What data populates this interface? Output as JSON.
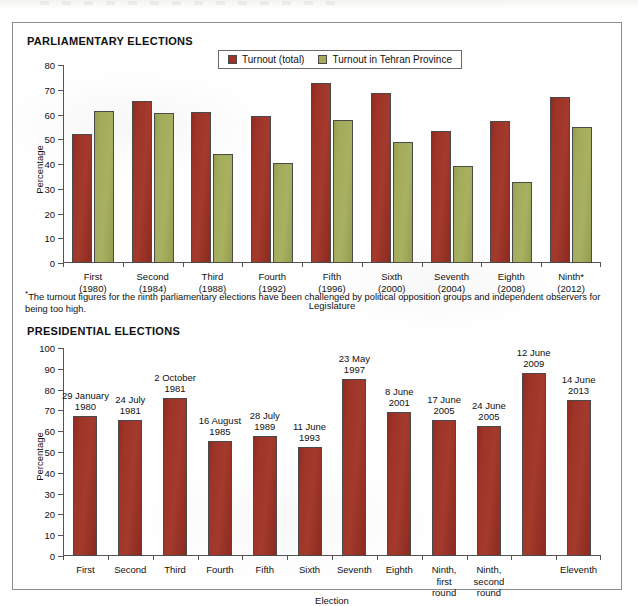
{
  "figure": {
    "parliamentary_title": "PARLIAMENTARY ELECTIONS",
    "presidential_title": "PRESIDENTIAL ELECTIONS",
    "footnote_marker": "*",
    "footnote": "The turnout figures for the ninth parliamentary elections have been challenged by political opposition groups and independent observers for being too high."
  },
  "colors": {
    "turnout_total": "#9e3328",
    "turnout_tehran": "#a3ab5b",
    "axis": "#555555",
    "text": "#111111",
    "frame": "#8c8c8c"
  },
  "chart_data": [
    {
      "id": "parliamentary",
      "type": "bar",
      "title": "PARLIAMENTARY ELECTIONS",
      "xlabel": "Legislature",
      "ylabel": "Percentage",
      "ylim": [
        0,
        80
      ],
      "yticks": [
        0,
        10,
        20,
        30,
        40,
        50,
        60,
        70,
        80
      ],
      "grid": false,
      "legend_position": "top-center",
      "categories": [
        "First\n(1980)",
        "Second\n(1984)",
        "Third\n(1988)",
        "Fourth\n(1992)",
        "Fifth\n(1996)",
        "Sixth\n(2000)",
        "Seventh\n(2004)",
        "Eighth\n(2008)",
        "Ninth*\n(2012)"
      ],
      "series": [
        {
          "name": "Turnout (total)",
          "color": "#9e3328",
          "values": [
            52.1,
            65.6,
            60.9,
            59.3,
            72.6,
            68.8,
            53.2,
            57.4,
            66.9
          ]
        },
        {
          "name": "Turnout in Tehran Province",
          "color": "#a3ab5b",
          "values": [
            61.3,
            60.7,
            44.0,
            40.4,
            57.8,
            48.9,
            39.4,
            32.9,
            55.0
          ]
        }
      ]
    },
    {
      "id": "presidential",
      "type": "bar",
      "title": "PRESIDENTIAL ELECTIONS",
      "xlabel": "Election",
      "ylabel": "Percentage",
      "ylim": [
        0,
        100
      ],
      "yticks": [
        0,
        10,
        20,
        30,
        40,
        50,
        60,
        70,
        80,
        90,
        100
      ],
      "grid": false,
      "legend_position": "none",
      "categories": [
        "First",
        "Second",
        "Third",
        "Fourth",
        "Fifth",
        "Sixth",
        "Seventh",
        "Eighth",
        "Ninth,\nfirst\nround",
        "Ninth,\nsecond\nround",
        "",
        "Eleventh"
      ],
      "point_labels": [
        "29 January\n1980",
        "24 July\n1981",
        "2 October\n1981",
        "16 August\n1985",
        "28 July\n1989",
        "11 June\n1993",
        "23 May\n1997",
        "8 June\n2001",
        "17 June\n2005",
        "24 June\n2005",
        "12 June\n2009",
        "14 June\n2013"
      ],
      "series": [
        {
          "name": "Turnout",
          "color": "#9e3328",
          "values": [
            67.4,
            65.6,
            76.0,
            55.2,
            57.5,
            52.4,
            85.0,
            69.0,
            65.3,
            62.5,
            88.0,
            75.1
          ]
        }
      ]
    }
  ]
}
